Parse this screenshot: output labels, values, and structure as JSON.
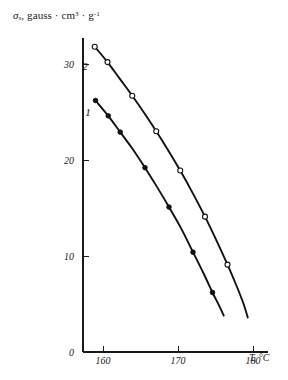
{
  "chart_data": {
    "type": "line",
    "title": "",
    "subtitle": "",
    "xlabel": "T, °C",
    "ylabel": "σs, gauss · cm3 · g-1",
    "ylabel_parts": {
      "symbol": "σ",
      "subscript": "s",
      "rest_1": ", gauss · cm",
      "sup_1": "3",
      "rest_2": " · g",
      "sup_2": "-1"
    },
    "xlabel_parts": {
      "symbol": "T",
      "rest": ", °C"
    },
    "xlim": [
      152,
      184
    ],
    "ylim": [
      0,
      34
    ],
    "grid": false,
    "legend_position": "inline-curve-labels",
    "x_ticks": [
      160,
      170,
      180
    ],
    "x_tick_labels": [
      "160",
      "170",
      "180"
    ],
    "y_ticks": [
      0,
      10,
      20,
      30
    ],
    "y_tick_labels": [
      "0",
      "10",
      "20",
      "30"
    ],
    "axis_color": "#1a1a1a",
    "curve_color": "#111111",
    "series": [
      {
        "name": "1",
        "label": "1",
        "marker": "filled-circle",
        "marker_fill": "#111111",
        "label_x": 158.0,
        "label_y": 24.6,
        "x": [
          159.0,
          160.7,
          162.3,
          164.0,
          165.6,
          167.2,
          168.8,
          170.4,
          172.0,
          173.4,
          174.6,
          175.5,
          176.1
        ],
        "y": [
          26.2,
          24.6,
          22.9,
          21.1,
          19.2,
          17.2,
          15.1,
          12.9,
          10.4,
          8.2,
          6.2,
          4.8,
          3.8
        ],
        "marker_x": [
          159.0,
          160.7,
          162.3,
          165.6,
          168.8,
          172.0,
          174.6
        ],
        "marker_y": [
          26.2,
          24.6,
          22.9,
          19.2,
          15.1,
          10.4,
          6.2
        ]
      },
      {
        "name": "2",
        "label": "2",
        "marker": "open-circle",
        "marker_fill": "#ffffff",
        "label_x": 157.6,
        "label_y": 29.4,
        "x": [
          158.9,
          160.6,
          162.2,
          163.9,
          165.5,
          167.1,
          168.7,
          170.3,
          172.0,
          173.6,
          175.2,
          176.6,
          177.8,
          178.7,
          179.3
        ],
        "y": [
          31.8,
          30.2,
          28.5,
          26.7,
          24.9,
          23.0,
          21.0,
          18.9,
          16.5,
          14.1,
          11.5,
          9.1,
          6.9,
          5.1,
          3.6
        ],
        "marker_x": [
          158.9,
          160.6,
          163.9,
          167.1,
          170.3,
          173.6,
          176.6
        ],
        "marker_y": [
          31.8,
          30.2,
          26.7,
          23.0,
          18.9,
          14.1,
          9.1
        ]
      }
    ]
  }
}
